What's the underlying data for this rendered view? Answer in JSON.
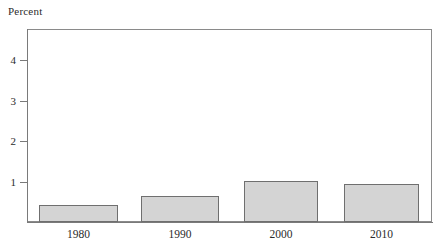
{
  "figure": {
    "axis_title": "Percent",
    "background_color": "#ffffff",
    "bar_fill_color": "#d4d4d4",
    "bar_edge_color": "#6f6f6f",
    "axis_color": "#7a7a7a",
    "text_color": "#2b2b2b"
  },
  "chart_data": {
    "type": "bar",
    "title": "",
    "subtitle": "",
    "xlabel": "",
    "ylabel": "Percent",
    "categories": [
      "1980",
      "1990",
      "2000",
      "2010"
    ],
    "values": [
      0.43,
      0.64,
      1.01,
      0.94
    ],
    "ylim": [
      0,
      4.75
    ],
    "yticks": [
      1,
      2,
      3,
      4
    ],
    "ytick_labels": [
      "1",
      "2",
      "3",
      "4"
    ],
    "xtick_labels": [
      "1980",
      "1990",
      "2000",
      "2010"
    ],
    "grid": false,
    "legend": null,
    "legend_position": "none",
    "annotations": []
  },
  "geometry": {
    "plot_left": 27,
    "plot_top": 29,
    "plot_right": 432,
    "plot_bottom": 222,
    "unit_px": 40.5,
    "bars": [
      {
        "left": 39,
        "width": 79,
        "top": 204.5
      },
      {
        "left": 141,
        "width": 78,
        "top": 196.0
      },
      {
        "left": 244,
        "width": 74,
        "top": 181.0
      },
      {
        "left": 344,
        "width": 75,
        "top": 184.0
      }
    ],
    "yticks_y": [
      182,
      141,
      101,
      60
    ]
  }
}
